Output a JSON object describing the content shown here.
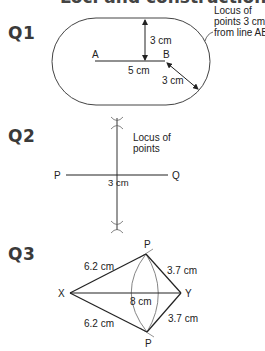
{
  "heading": "Loci and constructions (page 25)",
  "questions": [
    {
      "label": "Q1",
      "point_a": "A",
      "point_b": "B",
      "ab_length": "5 cm",
      "vertical_distance": "3 cm",
      "diagonal_distance": "3 cm",
      "annotation": [
        "Locus of",
        "points 3 cm",
        "from line AB"
      ]
    },
    {
      "label": "Q2",
      "point_p": "P",
      "point_q": "Q",
      "pq_mid_label": "3 cm",
      "annotation": [
        "Locus of",
        "points"
      ]
    },
    {
      "label": "Q3",
      "point_x": "X",
      "point_y": "Y",
      "point_p_top": "P",
      "point_p_bottom": "P",
      "xp_top": "6.2 cm",
      "xp_bottom": "6.2 cm",
      "yp_top": "3.7 cm",
      "yp_bottom": "3.7 cm",
      "xy_length": "8 cm"
    }
  ],
  "colors": {
    "line": "#222222",
    "arc": "#666666",
    "label": "#3a3a3a"
  }
}
